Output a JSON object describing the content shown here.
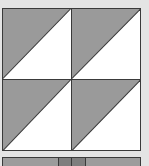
{
  "diagram": {
    "type": "quilt-block",
    "name": "half-square triangles",
    "grid": {
      "rows": 2,
      "cols": 2
    },
    "colors": {
      "background": "#e4e4e4",
      "dark_fabric": "#9a9a9a",
      "light_fabric": "#ffffff",
      "seam": "#3a3a3a",
      "strip": "#9c9c9c",
      "strip_dark": "#7e7e7e"
    },
    "cells": [
      {
        "row": 0,
        "col": 0,
        "dark": "upper-left",
        "light": "lower-right",
        "diagonal": "bottom-left-to-top-right"
      },
      {
        "row": 0,
        "col": 1,
        "dark": "upper-left",
        "light": "lower-right",
        "diagonal": "bottom-left-to-top-right"
      },
      {
        "row": 1,
        "col": 0,
        "dark": "upper-left",
        "light": "lower-right",
        "diagonal": "bottom-left-to-top-right"
      },
      {
        "row": 1,
        "col": 1,
        "dark": "upper-left",
        "light": "lower-right",
        "diagonal": "bottom-left-to-top-right"
      }
    ],
    "bottom_strip": {
      "segments": [
        {
          "width_pct": 40,
          "shade": "mid"
        },
        {
          "width_pct": 10,
          "shade": "dark"
        },
        {
          "width_pct": 10,
          "shade": "dark"
        },
        {
          "width_pct": 40,
          "shade": "mid"
        }
      ]
    }
  }
}
